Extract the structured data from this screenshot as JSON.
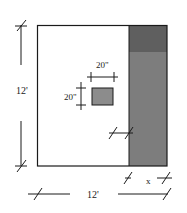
{
  "diagram": {
    "type": "room-floor-plan",
    "room": {
      "width_label": "12'",
      "height_label": "12'"
    },
    "object": {
      "width_label": "20\"",
      "height_label": "20\""
    },
    "strip": {
      "width_label": "x"
    },
    "colors": {
      "line": "#1a1a1a",
      "strip_fill": "#7a7a7a",
      "strip_top_fill": "#5e5e5e",
      "object_fill": "#8c8c8c",
      "background": "#ffffff"
    }
  }
}
